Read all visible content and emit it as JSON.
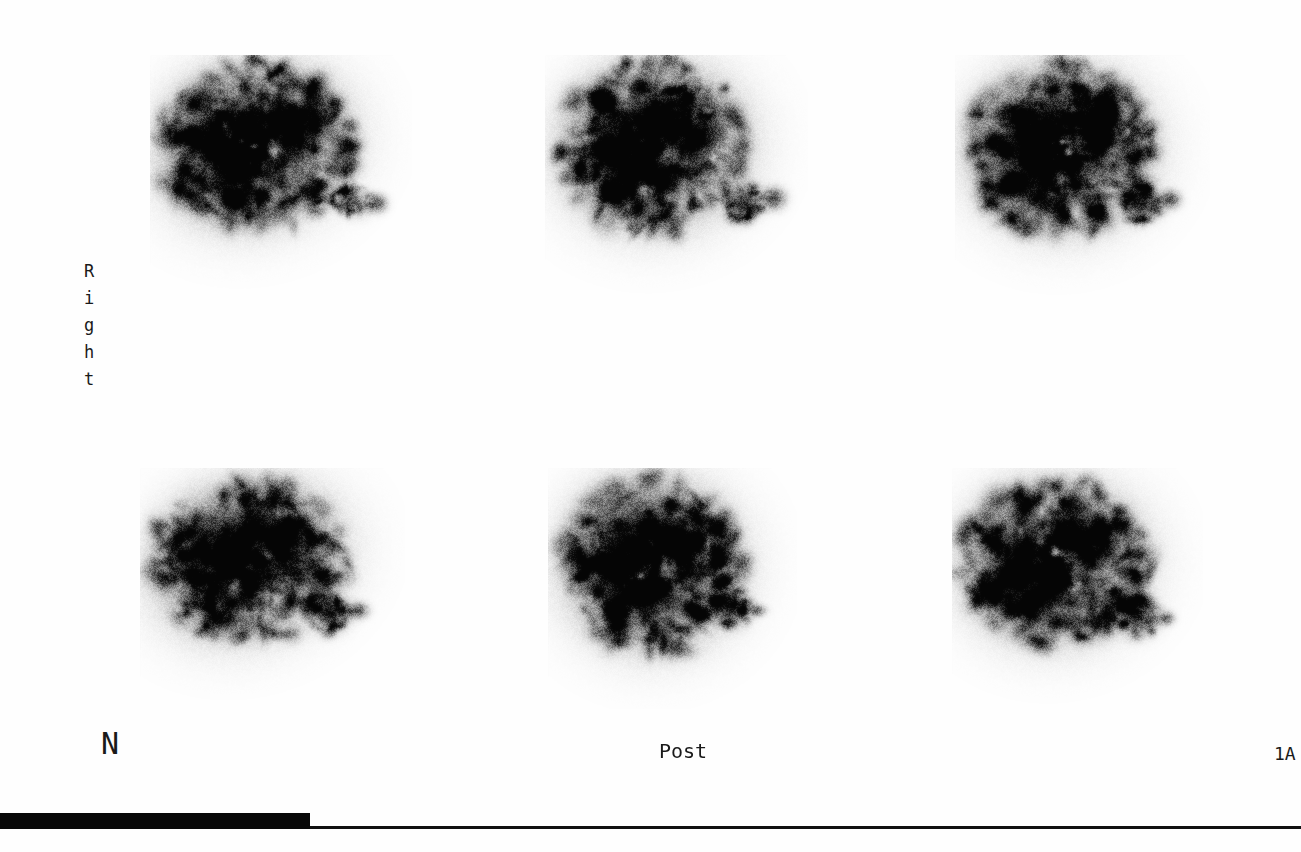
{
  "study": {
    "modality_title": "Liver-Spleen Scintigraphy Film",
    "orientation_label": "Right",
    "orientation_letters": [
      "R",
      "i",
      "g",
      "h",
      "t"
    ],
    "patient_marker": "N",
    "view_label": "Post",
    "frame_label": "1A"
  },
  "bottom_bar": {
    "fill_label": "exposure-fill",
    "fill_percent": 23.8,
    "fill_width_px": 310,
    "track_width_px": 1301,
    "fill_color": "#080808",
    "track_color": "#111111"
  },
  "canvas": {
    "background_color": "#fefefe",
    "ink_color": "#141414"
  },
  "scans": [
    {
      "id": "scan-r1c1",
      "position": "top-left",
      "left": 150,
      "top": 55,
      "seed": 1101,
      "liver": {
        "cx": 105,
        "cy": 90,
        "rx": 78,
        "ry": 66,
        "rot": -18,
        "intensity": 0.88
      },
      "spleen": {
        "cx": 200,
        "cy": 145,
        "rx": 17,
        "ry": 12,
        "rot": 35,
        "intensity": 0.7
      },
      "spleen2": {
        "cx": 228,
        "cy": 148,
        "rx": 9,
        "ry": 9,
        "rot": 0,
        "intensity": 0.62
      },
      "hot_spots": [
        {
          "cx": 62,
          "cy": 95,
          "r": 12,
          "intensity": 0.95
        },
        {
          "cx": 82,
          "cy": 146,
          "r": 13,
          "intensity": 0.93
        },
        {
          "cx": 148,
          "cy": 58,
          "r": 11,
          "intensity": 0.84
        },
        {
          "cx": 72,
          "cy": 62,
          "r": 10,
          "intensity": 0.8
        }
      ],
      "cold_spots": [
        {
          "cx": 122,
          "cy": 92,
          "r": 13,
          "intensity": 0.55
        },
        {
          "cx": 108,
          "cy": 126,
          "r": 10,
          "intensity": 0.45
        }
      ]
    },
    {
      "id": "scan-r1c2",
      "position": "top-center",
      "left": 545,
      "top": 55,
      "seed": 2202,
      "liver": {
        "cx": 110,
        "cy": 92,
        "rx": 76,
        "ry": 68,
        "rot": -12,
        "intensity": 0.9
      },
      "spleen": {
        "cx": 198,
        "cy": 148,
        "rx": 15,
        "ry": 15,
        "rot": 0,
        "intensity": 0.8
      },
      "spleen2": {
        "cx": 228,
        "cy": 143,
        "rx": 12,
        "ry": 11,
        "rot": 0,
        "intensity": 0.74
      },
      "hot_spots": [
        {
          "cx": 58,
          "cy": 95,
          "r": 14,
          "intensity": 0.96
        },
        {
          "cx": 66,
          "cy": 135,
          "r": 13,
          "intensity": 0.92
        },
        {
          "cx": 112,
          "cy": 58,
          "r": 12,
          "intensity": 0.88
        },
        {
          "cx": 160,
          "cy": 62,
          "r": 11,
          "intensity": 0.82
        }
      ],
      "cold_spots": [
        {
          "cx": 126,
          "cy": 96,
          "r": 15,
          "intensity": 0.5
        },
        {
          "cx": 100,
          "cy": 132,
          "r": 11,
          "intensity": 0.48
        }
      ]
    },
    {
      "id": "scan-r1c3",
      "position": "top-right",
      "left": 955,
      "top": 55,
      "seed": 3303,
      "liver": {
        "cx": 106,
        "cy": 94,
        "rx": 74,
        "ry": 68,
        "rot": -8,
        "intensity": 0.9
      },
      "spleen": {
        "cx": 186,
        "cy": 148,
        "rx": 16,
        "ry": 15,
        "rot": 0,
        "intensity": 0.82
      },
      "spleen2": {
        "cx": 215,
        "cy": 144,
        "rx": 10,
        "ry": 9,
        "rot": 0,
        "intensity": 0.7
      },
      "hot_spots": [
        {
          "cx": 68,
          "cy": 62,
          "r": 13,
          "intensity": 0.95
        },
        {
          "cx": 45,
          "cy": 96,
          "r": 12,
          "intensity": 0.93
        },
        {
          "cx": 60,
          "cy": 128,
          "r": 13,
          "intensity": 0.92
        },
        {
          "cx": 152,
          "cy": 58,
          "r": 12,
          "intensity": 0.86
        }
      ],
      "cold_spots": [
        {
          "cx": 118,
          "cy": 86,
          "r": 14,
          "intensity": 0.52
        },
        {
          "cx": 106,
          "cy": 122,
          "r": 11,
          "intensity": 0.46
        }
      ]
    },
    {
      "id": "scan-r2c1",
      "position": "bottom-left",
      "left": 140,
      "top": 468,
      "seed": 4404,
      "liver": {
        "cx": 108,
        "cy": 92,
        "rx": 78,
        "ry": 64,
        "rot": -20,
        "intensity": 0.86
      },
      "spleen": {
        "cx": 190,
        "cy": 145,
        "rx": 17,
        "ry": 16,
        "rot": 0,
        "intensity": 0.8
      },
      "spleen2": {
        "cx": 218,
        "cy": 142,
        "rx": 10,
        "ry": 8,
        "rot": 0,
        "intensity": 0.68
      },
      "hot_spots": [
        {
          "cx": 58,
          "cy": 82,
          "r": 11,
          "intensity": 0.94
        },
        {
          "cx": 56,
          "cy": 112,
          "r": 10,
          "intensity": 0.9
        },
        {
          "cx": 86,
          "cy": 152,
          "r": 13,
          "intensity": 0.94
        },
        {
          "cx": 148,
          "cy": 60,
          "r": 11,
          "intensity": 0.8
        }
      ],
      "cold_spots": [
        {
          "cx": 120,
          "cy": 86,
          "r": 15,
          "intensity": 0.48
        },
        {
          "cx": 96,
          "cy": 118,
          "r": 11,
          "intensity": 0.52
        }
      ]
    },
    {
      "id": "scan-r2c2",
      "position": "bottom-center",
      "left": 548,
      "top": 468,
      "seed": 5505,
      "liver": {
        "cx": 104,
        "cy": 96,
        "rx": 72,
        "ry": 70,
        "rot": -14,
        "intensity": 0.88
      },
      "spleen": {
        "cx": 182,
        "cy": 140,
        "rx": 16,
        "ry": 16,
        "rot": 0,
        "intensity": 0.84
      },
      "spleen2": {
        "cx": 208,
        "cy": 142,
        "rx": 9,
        "ry": 6,
        "rot": 0,
        "intensity": 0.62
      },
      "hot_spots": [
        {
          "cx": 55,
          "cy": 100,
          "r": 13,
          "intensity": 0.94
        },
        {
          "cx": 68,
          "cy": 145,
          "r": 12,
          "intensity": 0.9
        },
        {
          "cx": 100,
          "cy": 58,
          "r": 12,
          "intensity": 0.86
        },
        {
          "cx": 146,
          "cy": 72,
          "r": 11,
          "intensity": 0.82
        }
      ],
      "cold_spots": [
        {
          "cx": 120,
          "cy": 102,
          "r": 16,
          "intensity": 0.46
        },
        {
          "cx": 104,
          "cy": 74,
          "r": 10,
          "intensity": 0.55
        }
      ]
    },
    {
      "id": "scan-r2c3",
      "position": "bottom-right",
      "left": 952,
      "top": 468,
      "seed": 6606,
      "liver": {
        "cx": 102,
        "cy": 94,
        "rx": 74,
        "ry": 66,
        "rot": -10,
        "intensity": 0.88
      },
      "spleen": {
        "cx": 185,
        "cy": 148,
        "rx": 18,
        "ry": 17,
        "rot": 0,
        "intensity": 0.86
      },
      "spleen2": {
        "cx": 214,
        "cy": 150,
        "rx": 8,
        "ry": 7,
        "rot": 0,
        "intensity": 0.6
      },
      "hot_spots": [
        {
          "cx": 50,
          "cy": 112,
          "r": 13,
          "intensity": 0.95
        },
        {
          "cx": 62,
          "cy": 142,
          "r": 12,
          "intensity": 0.9
        },
        {
          "cx": 150,
          "cy": 70,
          "r": 12,
          "intensity": 0.88
        },
        {
          "cx": 104,
          "cy": 152,
          "r": 11,
          "intensity": 0.86
        }
      ],
      "cold_spots": [
        {
          "cx": 118,
          "cy": 96,
          "r": 15,
          "intensity": 0.48
        },
        {
          "cx": 90,
          "cy": 68,
          "r": 11,
          "intensity": 0.54
        }
      ]
    }
  ]
}
